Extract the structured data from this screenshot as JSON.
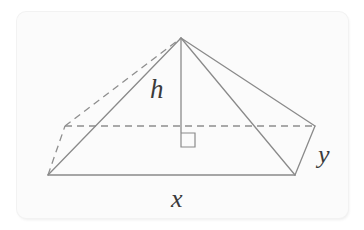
{
  "figure": {
    "kind": "geometry-diagram",
    "card": {
      "background_color": "#fbfbfb",
      "border_color": "#f2f2f2",
      "corner_radius_px": 9
    },
    "page_background_color": "#ffffff",
    "stroke": {
      "solid_color": "#8a8a8a",
      "dashed_color": "#8e8e8e",
      "width_px": 1.3,
      "dash_pattern": "7 5"
    },
    "labels": [
      {
        "id": "h",
        "text": "h",
        "meaning": "height",
        "x": 150,
        "y": 76
      },
      {
        "id": "x",
        "text": "x",
        "meaning": "base-length",
        "x": 171,
        "y": 186
      },
      {
        "id": "y",
        "text": "y",
        "meaning": "base-width",
        "x": 318,
        "y": 142
      }
    ],
    "vertices": {
      "apex": {
        "x": 181,
        "y": 38
      },
      "front_left": {
        "x": 48,
        "y": 175
      },
      "front_right": {
        "x": 295,
        "y": 175
      },
      "back_left": {
        "x": 65,
        "y": 126
      },
      "back_right": {
        "x": 315,
        "y": 126
      },
      "foot_of_height": {
        "x": 181,
        "y": 133
      }
    },
    "edges": [
      {
        "name": "base-front",
        "from": "front_left",
        "to": "front_right",
        "style": "solid"
      },
      {
        "name": "base-right",
        "from": "front_right",
        "to": "back_right",
        "style": "solid"
      },
      {
        "name": "base-back",
        "from": "back_left",
        "to": "back_right",
        "style": "dashed"
      },
      {
        "name": "base-left",
        "from": "front_left",
        "to": "back_left",
        "style": "dashed"
      },
      {
        "name": "lateral-front-left",
        "from": "front_left",
        "to": "apex",
        "style": "solid"
      },
      {
        "name": "lateral-front-right",
        "from": "front_right",
        "to": "apex",
        "style": "solid"
      },
      {
        "name": "lateral-back-right",
        "from": "back_right",
        "to": "apex",
        "style": "solid"
      },
      {
        "name": "lateral-back-left",
        "from": "back_left",
        "to": "apex",
        "style": "dashed"
      },
      {
        "name": "height-segment",
        "from": "apex",
        "to": "foot_of_height",
        "style": "solid"
      }
    ],
    "right_angle_marker": {
      "name": "right-angle-square",
      "x": 181,
      "y": 133,
      "size_px": 14,
      "indicates": "height perpendicular to base"
    }
  }
}
